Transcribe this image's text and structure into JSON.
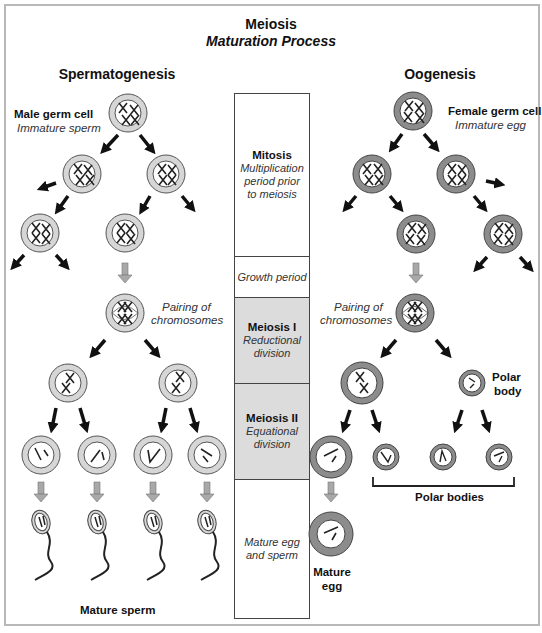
{
  "header": {
    "title": "Meiosis",
    "subtitle": "Maturation Process"
  },
  "spermatogenesis": {
    "heading": "Spermatogenesis",
    "germ_cell_label": "Male germ cell",
    "germ_cell_sublabel": "Immature sperm",
    "pairing_label_line1": "Pairing of",
    "pairing_label_line2": "chromosomes",
    "final_label": "Mature sperm",
    "cell_fill": "#d6d6d6"
  },
  "oogenesis": {
    "heading": "Oogenesis",
    "germ_cell_label": "Female germ cell",
    "germ_cell_sublabel": "Immature egg",
    "pairing_label_line1": "Pairing of",
    "pairing_label_line2": "chromosomes",
    "polar_body_label_line1": "Polar",
    "polar_body_label_line2": "body",
    "polar_bodies_label": "Polar bodies",
    "mature_egg_label_line1": "Mature",
    "mature_egg_label_line2": "egg",
    "cell_fill": "#8c8c8c"
  },
  "stages": [
    {
      "name": "Mitosis",
      "desc": "Multiplication period prior to meiosis",
      "shaded": false
    },
    {
      "name": "",
      "desc": "Growth period",
      "shaded": false
    },
    {
      "name": "Meiosis I",
      "desc": "Reductional division",
      "shaded": true
    },
    {
      "name": "Meiosis II",
      "desc": "Equational division",
      "shaded": true
    },
    {
      "name": "",
      "desc": "Mature egg and sperm",
      "shaded": false
    }
  ],
  "colors": {
    "stage_shade": "#dcdcdc",
    "arrow_black": "#111111",
    "arrow_gray": "#a8a8a8",
    "frame_border": "#b8b8b8"
  }
}
